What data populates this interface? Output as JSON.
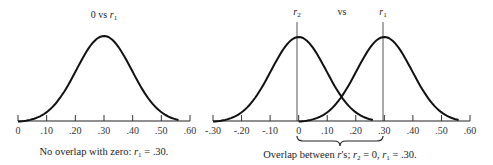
{
  "chart_data": [
    {
      "type": "line",
      "title": "0 vs r1",
      "title_parts": {
        "left": "0 vs ",
        "var": "r",
        "sub": "1"
      },
      "caption": "No overlap with zero: r1 = .30.",
      "caption_parts": {
        "pre": "No overlap with zero: ",
        "var": "r",
        "sub": "1",
        "post": " = .30."
      },
      "xlabel": "",
      "ylabel": "",
      "xlim": [
        0,
        0.6
      ],
      "ticks": [
        "0",
        ".10",
        ".20",
        ".30",
        ".40",
        ".50",
        ".60"
      ],
      "series": [
        {
          "name": "r1 sampling distribution",
          "mean": 0.3,
          "x_range": [
            0.0,
            0.56
          ],
          "shape": "normal"
        }
      ],
      "grid": false
    },
    {
      "type": "line",
      "title": "r2 vs r1",
      "title_parts": {
        "left_var": "r",
        "left_sub": "2",
        "mid": "vs",
        "right_var": "r",
        "right_sub": "1"
      },
      "caption": "Overlap between r's; r2 = 0, r1 = .30.",
      "caption_parts": {
        "pre": "Overlap between ",
        "var": "r",
        "mid": "'s; ",
        "var2": "r",
        "sub2": "2",
        "mid2": " = 0,  ",
        "var3": "r",
        "sub3": "1",
        "post": " = .30."
      },
      "xlabel": "",
      "ylabel": "",
      "xlim": [
        -0.3,
        0.6
      ],
      "ticks": [
        "-.30",
        "-.20",
        "-.10",
        "0",
        ".10",
        ".20",
        ".30",
        ".40",
        ".50",
        ".60"
      ],
      "series": [
        {
          "name": "r2 sampling distribution",
          "mean": 0.0,
          "x_range": [
            -0.3,
            0.26
          ],
          "shape": "normal"
        },
        {
          "name": "r1 sampling distribution",
          "mean": 0.3,
          "x_range": [
            0.0,
            0.56
          ],
          "shape": "normal"
        }
      ],
      "annotations": [
        {
          "type": "vertical-line",
          "x": 0.0,
          "label": "r2"
        },
        {
          "type": "vertical-line",
          "x": 0.3,
          "label": "r1"
        },
        {
          "type": "brace",
          "from": 0.0,
          "to": 0.3
        }
      ],
      "grid": false
    }
  ]
}
